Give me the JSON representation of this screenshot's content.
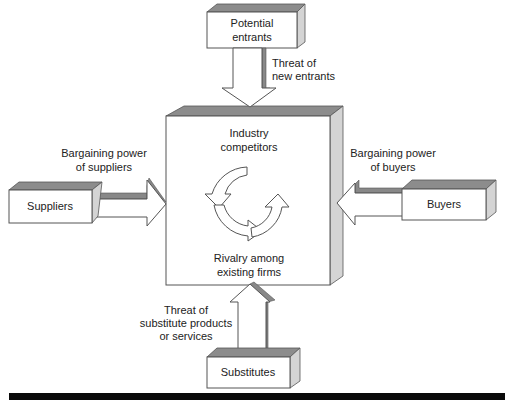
{
  "boxes": {
    "potential_entrants": [
      "Potential",
      "entrants"
    ],
    "industry_competitors": [
      "Industry",
      "competitors"
    ],
    "rivalry": [
      "Rivalry among",
      "existing firms"
    ],
    "suppliers": "Suppliers",
    "buyers": "Buyers",
    "substitutes": "Substitutes"
  },
  "forces": {
    "new_entrants": [
      "Threat of",
      "new entrants"
    ],
    "suppliers_power": [
      "Bargaining power",
      "of suppliers"
    ],
    "buyers_power": [
      "Bargaining power",
      "of buyers"
    ],
    "substitutes_threat": [
      "Threat of",
      "substitute products",
      "or services"
    ]
  },
  "colors": {
    "top_face": "#8c8c8c",
    "side_face": "#d4d4d4",
    "footer_bar": "#0a0a0a"
  }
}
